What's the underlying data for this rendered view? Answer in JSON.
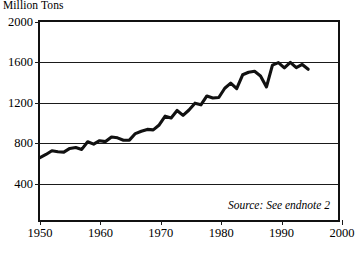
{
  "chart_data": {
    "type": "line",
    "title": "",
    "ylabel": "Million Tons",
    "xlabel": "",
    "xlim": [
      1950,
      2000
    ],
    "ylim": [
      0,
      2000
    ],
    "grid": true,
    "legend": null,
    "y_ticks": [
      400,
      800,
      1200,
      1600,
      2000
    ],
    "x_ticks": [
      1950,
      1960,
      1970,
      1980,
      1990,
      2000
    ],
    "annotations": [
      {
        "text": "Source: See endnote 2",
        "style": "italic",
        "position": "bottom-right-inside-plot"
      }
    ],
    "series": [
      {
        "name": "Production",
        "x": [
          1950,
          1951,
          1952,
          1953,
          1954,
          1955,
          1956,
          1957,
          1958,
          1959,
          1960,
          1961,
          1962,
          1963,
          1964,
          1965,
          1966,
          1967,
          1968,
          1969,
          1970,
          1971,
          1972,
          1973,
          1974,
          1975,
          1976,
          1977,
          1978,
          1979,
          1980,
          1981,
          1982,
          1983,
          1984,
          1985,
          1986,
          1987,
          1988,
          1989,
          1990,
          1991,
          1992,
          1993,
          1994,
          1995
        ],
        "values": [
          631,
          662,
          700,
          690,
          686,
          723,
          732,
          713,
          790,
          766,
          801,
          792,
          839,
          830,
          806,
          807,
          873,
          897,
          915,
          910,
          960,
          1049,
          1030,
          1106,
          1057,
          1111,
          1180,
          1163,
          1253,
          1233,
          1237,
          1331,
          1383,
          1327,
          1467,
          1492,
          1502,
          1455,
          1344,
          1564,
          1589,
          1536,
          1592,
          1539,
          1571,
          1522
        ]
      }
    ]
  },
  "figure": {
    "y_axis_title": "Million Tons",
    "source_note": "Source: See endnote 2",
    "caption": ""
  }
}
